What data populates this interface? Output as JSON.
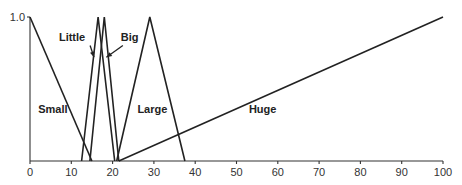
{
  "chart_data": {
    "type": "line",
    "title": "",
    "xlabel": "",
    "ylabel": "",
    "xlim": [
      0,
      100
    ],
    "ylim": [
      0,
      1.0
    ],
    "grid": false,
    "x_ticks": [
      0,
      10,
      20,
      30,
      40,
      50,
      60,
      70,
      80,
      90,
      100
    ],
    "y_ticks": [
      1.0
    ],
    "y_tick_labels": [
      "1.0"
    ],
    "series": [
      {
        "name": "Small",
        "points": [
          [
            0,
            1.0
          ],
          [
            15,
            0
          ]
        ]
      },
      {
        "name": "Little",
        "points": [
          [
            12.5,
            0
          ],
          [
            16.5,
            1.0
          ],
          [
            20.5,
            0
          ]
        ]
      },
      {
        "name": "Big",
        "points": [
          [
            14.5,
            0
          ],
          [
            18,
            1.0
          ],
          [
            21.5,
            0
          ]
        ]
      },
      {
        "name": "Large",
        "points": [
          [
            21,
            0
          ],
          [
            29,
            1.0
          ],
          [
            37.5,
            0
          ]
        ]
      },
      {
        "name": "Huge",
        "points": [
          [
            21.5,
            0
          ],
          [
            100,
            1.0
          ]
        ]
      }
    ],
    "annotations": [
      {
        "text": "Small",
        "x": 2,
        "y": 0.33
      },
      {
        "text": "Little",
        "x": 7,
        "y": 0.83,
        "arrow_to": [
          15.5,
          0.72
        ]
      },
      {
        "text": "Big",
        "x": 22,
        "y": 0.83,
        "arrow_to": [
          18.5,
          0.72
        ]
      },
      {
        "text": "Large",
        "x": 26,
        "y": 0.33
      },
      {
        "text": "Huge",
        "x": 53,
        "y": 0.33
      }
    ]
  }
}
